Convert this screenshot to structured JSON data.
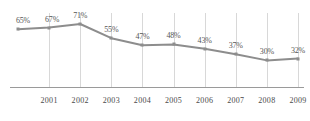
{
  "chart_data": {
    "type": "line",
    "title": "",
    "subtitle": "",
    "xlabel": "",
    "ylabel": "",
    "categories": [
      "",
      "2001",
      "2002",
      "2003",
      "2004",
      "2005",
      "2006",
      "2007",
      "2008",
      "2009"
    ],
    "tick_labels": [
      "2001",
      "2002",
      "2003",
      "2004",
      "2005",
      "2006",
      "2007",
      "2008",
      "2009"
    ],
    "values": [
      65,
      67,
      71,
      55,
      47,
      48,
      43,
      37,
      30,
      32
    ],
    "data_labels": [
      "65%",
      "67%",
      "71%",
      "55%",
      "47%",
      "48%",
      "43%",
      "37%",
      "30%",
      "32%"
    ],
    "ylim": [
      0,
      80
    ],
    "xlim": [
      0,
      9
    ],
    "grid": "vertical",
    "legend": "none",
    "series": [
      {
        "name": "series-1",
        "values": [
          65,
          67,
          71,
          55,
          47,
          48,
          43,
          37,
          30,
          32
        ]
      }
    ],
    "colors": {
      "line": "#8d8d8d",
      "marker": "#8d8d8d",
      "gridline": "#d8d8d8",
      "axis": "#9a9a9a",
      "label_text": "#555555",
      "tick_text": "#4a4a4a",
      "background": "#ffffff"
    }
  }
}
